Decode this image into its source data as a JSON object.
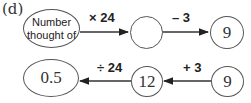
{
  "part_label": "(d)",
  "top_row": {
    "start": "Number thought of",
    "start_line1": "Number",
    "start_line2": "thought of",
    "op1": "× 24",
    "middle": "",
    "op2": "– 3",
    "end": "9"
  },
  "bottom_row": {
    "start": "9",
    "op1": "+ 3",
    "middle": "12",
    "op2": "÷ 24",
    "end": "0.5"
  }
}
